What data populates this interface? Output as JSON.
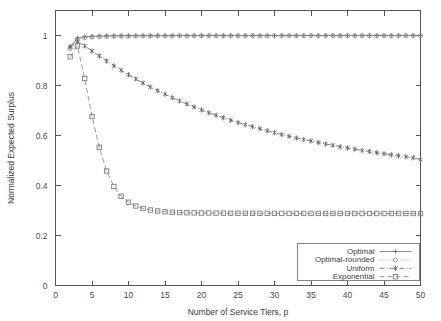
{
  "chart_data": {
    "type": "line",
    "title": "",
    "xlabel": "Number of Service Tiers, p",
    "ylabel": "Normalized Expected Surplus",
    "xlim": [
      0,
      50
    ],
    "ylim": [
      0,
      1.1
    ],
    "xticks": [
      0,
      5,
      10,
      15,
      20,
      25,
      30,
      35,
      40,
      45,
      50
    ],
    "xtick_labels": [
      "0",
      "5",
      "10",
      "15",
      "20",
      "25",
      "30",
      "35",
      "40",
      "45",
      "50"
    ],
    "yticks": [
      0,
      0.2,
      0.4,
      0.6,
      0.8,
      1
    ],
    "ytick_labels": [
      "0",
      "0.2",
      "0.4",
      "0.6",
      "0.8",
      "1"
    ],
    "grid": false,
    "legend_position": "bottom-right",
    "x": [
      2,
      3,
      4,
      5,
      6,
      7,
      8,
      9,
      10,
      11,
      12,
      13,
      14,
      15,
      16,
      17,
      18,
      19,
      20,
      21,
      22,
      23,
      24,
      25,
      26,
      27,
      28,
      29,
      30,
      31,
      32,
      33,
      34,
      35,
      36,
      37,
      38,
      39,
      40,
      41,
      42,
      43,
      44,
      45,
      46,
      47,
      48,
      49,
      50
    ],
    "series": [
      {
        "name": "Optimal",
        "marker": "plus",
        "linestyle": "solid",
        "color": "#6e6e6e",
        "values": [
          0.955,
          0.99,
          0.995,
          0.997,
          0.998,
          0.9985,
          0.999,
          0.9992,
          0.9994,
          0.9995,
          0.9996,
          0.9996,
          0.9997,
          0.9997,
          0.9998,
          0.9998,
          0.9998,
          0.9998,
          0.9999,
          0.9999,
          0.9999,
          0.9999,
          0.9999,
          0.9999,
          0.9999,
          1.0,
          1.0,
          1.0,
          1.0,
          1.0,
          1.0,
          1.0,
          1.0,
          1.0,
          1.0,
          1.0,
          1.0,
          1.0,
          1.0,
          1.0,
          1.0,
          1.0,
          1.0,
          1.0,
          1.0,
          1.0,
          1.0,
          1.0,
          1.0
        ]
      },
      {
        "name": "Optimal-rounded",
        "marker": "open-circle",
        "linestyle": "dotted",
        "color": "#8a8a8a",
        "values": [
          0.948,
          0.982,
          0.9915,
          0.994,
          0.9955,
          0.9962,
          0.9968,
          0.9972,
          0.9975,
          0.9978,
          0.998,
          0.9981,
          0.9982,
          0.9983,
          0.9984,
          0.9985,
          0.9986,
          0.9986,
          0.9987,
          0.9987,
          0.9988,
          0.9988,
          0.9989,
          0.9989,
          0.9989,
          0.999,
          0.999,
          0.999,
          0.999,
          0.9991,
          0.9991,
          0.9991,
          0.9991,
          0.9992,
          0.9992,
          0.9992,
          0.9992,
          0.9992,
          0.9993,
          0.9993,
          0.9993,
          0.9993,
          0.9993,
          0.9993,
          0.9993,
          0.9994,
          0.9994,
          0.9994,
          0.9994
        ]
      },
      {
        "name": "Uniform",
        "marker": "star",
        "linestyle": "dash-dot",
        "color": "#636363",
        "values": [
          0.955,
          0.975,
          0.958,
          0.938,
          0.918,
          0.898,
          0.879,
          0.861,
          0.843,
          0.826,
          0.81,
          0.794,
          0.779,
          0.765,
          0.751,
          0.738,
          0.726,
          0.714,
          0.702,
          0.691,
          0.681,
          0.671,
          0.661,
          0.652,
          0.643,
          0.635,
          0.627,
          0.619,
          0.611,
          0.604,
          0.597,
          0.59,
          0.584,
          0.578,
          0.572,
          0.566,
          0.561,
          0.555,
          0.55,
          0.545,
          0.54,
          0.536,
          0.531,
          0.527,
          0.523,
          0.519,
          0.515,
          0.511,
          0.503
        ]
      },
      {
        "name": "Exponential",
        "marker": "open-square",
        "linestyle": "dashed",
        "color": "#7d7d7d",
        "values": [
          0.915,
          0.958,
          0.828,
          0.676,
          0.553,
          0.458,
          0.396,
          0.357,
          0.333,
          0.318,
          0.308,
          0.302,
          0.298,
          0.295,
          0.293,
          0.292,
          0.291,
          0.2905,
          0.29,
          0.29,
          0.2895,
          0.2893,
          0.2891,
          0.289,
          0.2889,
          0.2888,
          0.2887,
          0.2886,
          0.2885,
          0.2885,
          0.2884,
          0.2884,
          0.2883,
          0.2883,
          0.2883,
          0.2882,
          0.2882,
          0.2882,
          0.2881,
          0.2881,
          0.2881,
          0.2881,
          0.288,
          0.288,
          0.288,
          0.288,
          0.288,
          0.288,
          0.2879
        ]
      }
    ]
  },
  "legend": {
    "entries": [
      {
        "label": "Optimal"
      },
      {
        "label": "Optimal-rounded"
      },
      {
        "label": "Uniform"
      },
      {
        "label": "Exponential"
      }
    ]
  }
}
